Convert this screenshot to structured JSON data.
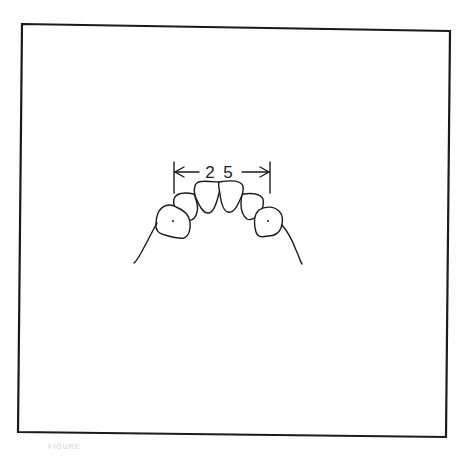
{
  "figure": {
    "caption": "FIGURE",
    "frame_color": "#1a1a1a",
    "line_color": "#1a1a1a",
    "background": "#ffffff"
  },
  "diagram": {
    "dimension": {
      "label": "2 5",
      "value": 25,
      "left_tick_x": 174,
      "right_tick_x": 270,
      "arrow_y": 172
    },
    "teeth": [
      {
        "name": "right-canine",
        "center_dot": true
      },
      {
        "name": "right-lateral-incisor"
      },
      {
        "name": "right-central-incisor"
      },
      {
        "name": "left-central-incisor"
      },
      {
        "name": "left-lateral-incisor"
      },
      {
        "name": "left-canine",
        "center_dot": true
      }
    ]
  }
}
